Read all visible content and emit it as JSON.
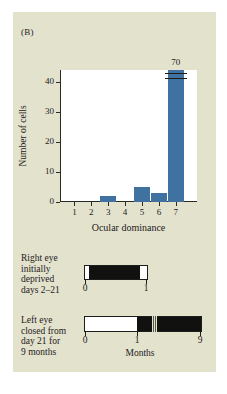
{
  "panel": {
    "label": "(B)",
    "background_color": "#e3e2cd",
    "plot_background_color": "#ffffff"
  },
  "chart_data": {
    "type": "bar",
    "title": "",
    "categories": [
      "1",
      "2",
      "3",
      "4",
      "5",
      "6",
      "7"
    ],
    "values": [
      0,
      0,
      2,
      0,
      5,
      3,
      70
    ],
    "value_labels": [
      "",
      "",
      "",
      "",
      "",
      "",
      "70"
    ],
    "xlabel": "Ocular dominance",
    "ylabel": "Number of cells",
    "ylim": [
      0,
      44
    ],
    "yticks": [
      0,
      10,
      20,
      30,
      40
    ],
    "ytick_labels": [
      "0",
      "10",
      "20",
      "30",
      "40"
    ],
    "grid": false,
    "legend": false,
    "bar_color": "#3f72a1",
    "axis_break": {
      "present": true,
      "category": "7",
      "note": "bar truncated; actual value 70 shown above break"
    }
  },
  "timelines": [
    {
      "caption": "Right eye\ninitially\ndeprived\ndays 2–21",
      "caption_lines": [
        "Right eye",
        "initially",
        "deprived",
        "days 2–21"
      ],
      "ticks": [
        {
          "label": "0",
          "position": 0
        },
        {
          "label": "1",
          "position": 1
        }
      ],
      "axis_label": "",
      "filled_from": 0.1,
      "filled_to": 0.88,
      "has_break": false
    },
    {
      "caption": "Left eye\nclosed from\nday 21 for\n9 months",
      "caption_lines": [
        "Left eye",
        "closed from",
        "day 21 for",
        "9 months"
      ],
      "ticks": [
        {
          "label": "0",
          "position": 0
        },
        {
          "label": "1",
          "position": 1
        },
        {
          "label": "9",
          "position": 9
        }
      ],
      "axis_label": "Months",
      "filled_from": 1,
      "filled_to": 9,
      "has_break": true
    }
  ]
}
